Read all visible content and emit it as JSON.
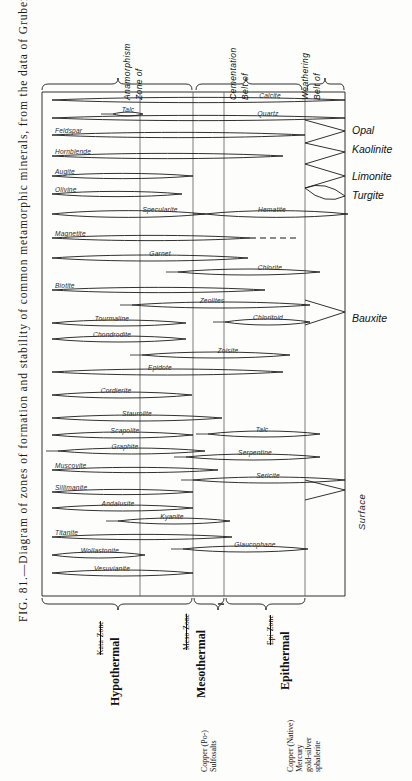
{
  "figure": {
    "caption": "FIG. 81.—Diagram of zones of formation and stability of common metamorphic minerals, from the data of Grubenmann.",
    "caption_number": "FIG. 81."
  },
  "top_headers": [
    {
      "id": "zone-of-anamorphism",
      "line1": "Zone of",
      "line2": "Anamorphism"
    },
    {
      "id": "belt-of-cementation",
      "line1": "Belt of",
      "line2": "Cementation"
    },
    {
      "id": "belt-of-weathering",
      "line1": "Belt of",
      "line2": "Weathering"
    }
  ],
  "right_labels": [
    {
      "id": "opal",
      "text": "Opal"
    },
    {
      "id": "kaolinite",
      "text": "Kaolinite"
    },
    {
      "id": "limonite",
      "text": "Limonite"
    },
    {
      "id": "turgite",
      "text": "Turgite"
    },
    {
      "id": "bauxite",
      "text": "Bauxite"
    }
  ],
  "surface_label": "Surface",
  "bottom_brackets": [
    {
      "id": "hypothermal",
      "name": "Hypothermal",
      "struck": "Kata-Zone",
      "ore": ""
    },
    {
      "id": "mesothermal",
      "name": "Mesothermal",
      "struck": "Meso-Zone",
      "ore": "Copper (Po-)\nSulfosalts"
    },
    {
      "id": "epithermal",
      "name": "Epithermal",
      "struck": "Epi-Zone",
      "ore": "Copper (Native)\nMercury\ngold-silver\nsphalerite"
    }
  ],
  "ore_notes": [
    {
      "id": "copper-sulfosalts",
      "lines": [
        "Copper (Po-)",
        "Sulfosalts"
      ]
    },
    {
      "id": "copper-native-group",
      "lines": [
        "Copper (Native)",
        "Mercury",
        "gold-silver",
        "sphalerite"
      ]
    }
  ],
  "chart_data": {
    "type": "range-band",
    "title": "Diagram of zones of formation and stability of common metamorphic minerals",
    "xlabel": "",
    "ylabel": "",
    "x_axis": {
      "zones": [
        "Zone of Anamorphism",
        "Belt of Cementation",
        "Belt of Weathering"
      ],
      "internal_dividers_px": [
        140,
        193,
        224,
        305
      ],
      "plot_left_px": 52,
      "plot_right_px": 345
    },
    "note": "Each mineral is drawn as a lens/leaf shaped band spanning its range of stability; label is set inside the band.",
    "bands": [
      {
        "name": "Calcite",
        "x0": 52,
        "x1": 345,
        "y": 100,
        "tip_left": 0,
        "tip_right": 345,
        "label_x": 270,
        "lens_l": 52,
        "lens_r": 345,
        "h": 7.0
      },
      {
        "name": "Quartz",
        "x0": 52,
        "x1": 345,
        "y": 118,
        "label_x": 268,
        "lens_l": 52,
        "lens_r": 345,
        "h": 7.0
      },
      {
        "name": "Talc",
        "x0": 113,
        "x1": 143,
        "y": 114,
        "label_x": 128,
        "lens_l": 113,
        "lens_r": 143,
        "h": 5.0
      },
      {
        "name": "Feldspar",
        "x0": 52,
        "x1": 305,
        "y": 135,
        "label_x": 56,
        "lens_l": 52,
        "lens_r": 305,
        "h": 7.0
      },
      {
        "name": "Hornblende",
        "x0": 52,
        "x1": 283,
        "y": 156,
        "label_x": 56,
        "lens_l": 52,
        "lens_r": 283,
        "h": 7.0
      },
      {
        "name": "Augite",
        "x0": 52,
        "x1": 193,
        "y": 176,
        "label_x": 56,
        "lens_l": 52,
        "lens_r": 193,
        "h": 7.0
      },
      {
        "name": "Olivine",
        "x0": 52,
        "x1": 182,
        "y": 194,
        "label_x": 56,
        "lens_l": 52,
        "lens_r": 182,
        "h": 7.0
      },
      {
        "name": "Specularite",
        "x0": 52,
        "x1": 205,
        "y": 214,
        "label_x": 160,
        "lens_l": 52,
        "lens_r": 205,
        "h": 9.0
      },
      {
        "name": "Hematite",
        "x0": 205,
        "x1": 348,
        "y": 214,
        "label_x": 272,
        "lens_l": 205,
        "lens_r": 348,
        "h": 9.0
      },
      {
        "name": "Magnetite",
        "x0": 52,
        "x1": 250,
        "y": 238,
        "label_x": 56,
        "lens_l": 52,
        "lens_r": 250,
        "h": 7.0,
        "dashed_to": 300
      },
      {
        "name": "Garnet",
        "x0": 52,
        "x1": 248,
        "y": 258,
        "label_x": 160,
        "lens_l": 52,
        "lens_r": 248,
        "h": 8.0
      },
      {
        "name": "Chlorite",
        "x0": 178,
        "x1": 320,
        "y": 272,
        "label_x": 270,
        "lens_l": 178,
        "lens_r": 320,
        "h": 8.0
      },
      {
        "name": "Biotite",
        "x0": 52,
        "x1": 265,
        "y": 290,
        "label_x": 56,
        "lens_l": 52,
        "lens_r": 265,
        "h": 7.0
      },
      {
        "name": "Zeolites",
        "x0": 132,
        "x1": 310,
        "y": 305,
        "label_x": 212,
        "lens_l": 132,
        "lens_r": 310,
        "h": 8.0
      },
      {
        "name": "Tourmaline",
        "x0": 52,
        "x1": 186,
        "y": 323,
        "label_x": 112,
        "lens_l": 52,
        "lens_r": 186,
        "h": 8.0
      },
      {
        "name": "Chloritoid",
        "x0": 225,
        "x1": 310,
        "y": 322,
        "label_x": 268,
        "lens_l": 225,
        "lens_r": 310,
        "h": 8.0
      },
      {
        "name": "Chondrodite",
        "x0": 52,
        "x1": 186,
        "y": 339,
        "label_x": 112,
        "lens_l": 52,
        "lens_r": 186,
        "h": 8.0
      },
      {
        "name": "Zoisite",
        "x0": 142,
        "x1": 290,
        "y": 355,
        "label_x": 228,
        "lens_l": 142,
        "lens_r": 290,
        "h": 8.0
      },
      {
        "name": "Epidote",
        "x0": 52,
        "x1": 283,
        "y": 372,
        "label_x": 160,
        "lens_l": 52,
        "lens_r": 283,
        "h": 8.0
      },
      {
        "name": "Cordierite",
        "x0": 52,
        "x1": 192,
        "y": 395,
        "label_x": 116,
        "lens_l": 52,
        "lens_r": 192,
        "h": 8.0
      },
      {
        "name": "Staurolite",
        "x0": 52,
        "x1": 222,
        "y": 418,
        "label_x": 137,
        "lens_l": 52,
        "lens_r": 222,
        "h": 8.0
      },
      {
        "name": "Scapolite",
        "x0": 52,
        "x1": 193,
        "y": 435,
        "label_x": 125,
        "lens_l": 52,
        "lens_r": 193,
        "h": 8.0
      },
      {
        "name": "Talc2",
        "x0": 208,
        "x1": 320,
        "y": 434,
        "label_x": 262,
        "lens_l": 208,
        "lens_r": 320,
        "h": 8.0
      },
      {
        "name": "Graphite",
        "x0": 58,
        "x1": 205,
        "y": 451,
        "label_x": 125,
        "lens_l": 58,
        "lens_r": 205,
        "h": 8.0
      },
      {
        "name": "Serpentine",
        "x0": 186,
        "x1": 320,
        "y": 457,
        "label_x": 255,
        "lens_l": 186,
        "lens_r": 320,
        "h": 8.0
      },
      {
        "name": "Muscovite",
        "x0": 52,
        "x1": 218,
        "y": 470,
        "label_x": 56,
        "lens_l": 52,
        "lens_r": 218,
        "h": 7.0
      },
      {
        "name": "Sericite",
        "x0": 193,
        "x1": 345,
        "y": 480,
        "label_x": 268,
        "lens_l": 193,
        "lens_r": 345,
        "h": 8.0
      },
      {
        "name": "Sillimanite",
        "x0": 52,
        "x1": 193,
        "y": 492,
        "label_x": 56,
        "lens_l": 52,
        "lens_r": 193,
        "h": 7.0
      },
      {
        "name": "Andalusite",
        "x0": 52,
        "x1": 193,
        "y": 508,
        "label_x": 118,
        "lens_l": 52,
        "lens_r": 193,
        "h": 8.0
      },
      {
        "name": "Kyanite",
        "x0": 118,
        "x1": 230,
        "y": 521,
        "label_x": 172,
        "lens_l": 118,
        "lens_r": 230,
        "h": 8.0
      },
      {
        "name": "Titanite",
        "x0": 52,
        "x1": 232,
        "y": 537,
        "label_x": 56,
        "lens_l": 52,
        "lens_r": 232,
        "h": 7.0
      },
      {
        "name": "Glaucophane",
        "x0": 183,
        "x1": 308,
        "y": 549,
        "label_x": 255,
        "lens_l": 183,
        "lens_r": 308,
        "h": 8.0
      },
      {
        "name": "Wollastonite",
        "x0": 52,
        "x1": 145,
        "y": 555,
        "label_x": 100,
        "lens_l": 52,
        "lens_r": 145,
        "h": 8.0
      },
      {
        "name": "Vesuvianite",
        "x0": 52,
        "x1": 193,
        "y": 573,
        "label_x": 112,
        "lens_l": 52,
        "lens_r": 193,
        "h": 8.0
      }
    ]
  }
}
